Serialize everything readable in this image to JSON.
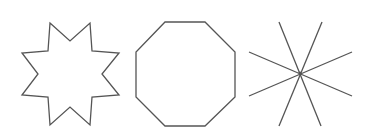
{
  "canvas": {
    "width": 370,
    "height": 136,
    "background": "#ffffff"
  },
  "stroke_color": "#555555",
  "shapes": [
    {
      "name": "eight-pointed-star",
      "type": "polygon",
      "points": "50,23 70,41 90,23 92,51 119,53 102,74 119,95 92,97 90,125 70,107 50,125 48,97 22,95 38,74 22,53 48,51"
    },
    {
      "name": "octagon",
      "type": "polygon",
      "points": "165,22 205,22 235,52 235,97 205,126 165,126 136,97 136,52"
    },
    {
      "name": "asterisk-eight-rays",
      "type": "lines",
      "center": [
        300,
        73
      ],
      "lines": [
        [
          279,
          22,
          321,
          126
        ],
        [
          322,
          22,
          279,
          126
        ],
        [
          249,
          52,
          352,
          96
        ],
        [
          352,
          52,
          249,
          96
        ]
      ]
    }
  ]
}
